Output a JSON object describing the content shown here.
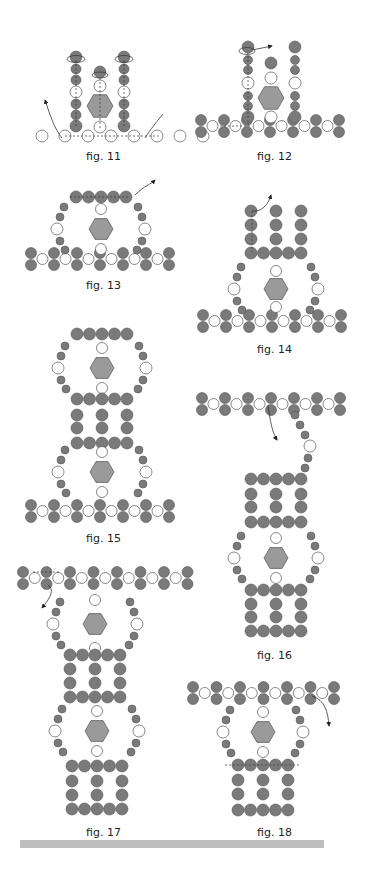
{
  "colors": {
    "dark_bead": "#7a7a7a",
    "white_bead": "#ffffff",
    "hexagon": "#9a9a9a",
    "stroke": "#555555",
    "footer_bar": "#bdbdbd"
  },
  "figures": [
    {
      "id": "fig11",
      "label": "fig. 11"
    },
    {
      "id": "fig12",
      "label": "fig. 12"
    },
    {
      "id": "fig13",
      "label": "fig. 13"
    },
    {
      "id": "fig14",
      "label": "fig. 14"
    },
    {
      "id": "fig15",
      "label": "fig. 15"
    },
    {
      "id": "fig16",
      "label": "fig. 16"
    },
    {
      "id": "fig17",
      "label": "fig. 17"
    },
    {
      "id": "fig18",
      "label": "fig. 18"
    }
  ]
}
